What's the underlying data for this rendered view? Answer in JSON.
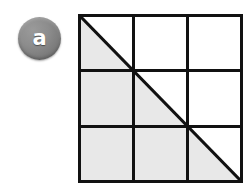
{
  "figure": {
    "background_color": "#ffffff",
    "part_label": {
      "text": "a",
      "badge_color": "#828282",
      "text_color": "#ffffff"
    },
    "diagram": {
      "type": "grid-with-diagonal",
      "description": "Three-by-three square grid with a diagonal drawn from the top-left corner to the bottom-right corner; the region below the diagonal is shaded.",
      "rows": 3,
      "columns": 3,
      "cell_count": 9,
      "line_color": "#111111",
      "shaded_fill_color": "#e8e8e8",
      "unshaded_fill_color": "#ffffff",
      "outer_border_width": 3,
      "inner_line_width": 3,
      "diagonal": {
        "from": "top-left",
        "to": "bottom-right",
        "width": 3,
        "color": "#111111"
      },
      "shaded_region": "below-diagonal",
      "shaded_fraction": "1/2",
      "cells": [
        {
          "row": 1,
          "column": 1,
          "shading": "half-shaded"
        },
        {
          "row": 1,
          "column": 2,
          "shading": "unshaded"
        },
        {
          "row": 1,
          "column": 3,
          "shading": "unshaded"
        },
        {
          "row": 2,
          "column": 1,
          "shading": "shaded"
        },
        {
          "row": 2,
          "column": 2,
          "shading": "half-shaded"
        },
        {
          "row": 2,
          "column": 3,
          "shading": "unshaded"
        },
        {
          "row": 3,
          "column": 1,
          "shading": "shaded"
        },
        {
          "row": 3,
          "column": 2,
          "shading": "shaded"
        },
        {
          "row": 3,
          "column": 3,
          "shading": "half-shaded"
        }
      ]
    }
  }
}
